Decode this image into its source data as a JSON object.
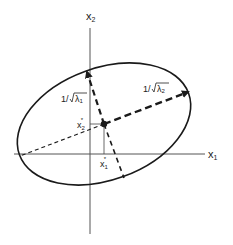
{
  "axes": {
    "x_label": "x",
    "x_sub": "1",
    "y_label": "x",
    "y_sub": "2"
  },
  "center": {
    "x1_label": "x",
    "x1_sub": "1",
    "x1_sup": "*",
    "x2_label": "x",
    "x2_sub": "2",
    "x2_sup": "*"
  },
  "annotations": {
    "minor_prefix": "1/",
    "minor_lambda": "λ",
    "minor_sub": "1",
    "major_prefix": "1/",
    "major_lambda": "λ",
    "major_sub": "2"
  },
  "colors": {
    "stroke": "#1a1a1a",
    "axis": "#555555"
  }
}
